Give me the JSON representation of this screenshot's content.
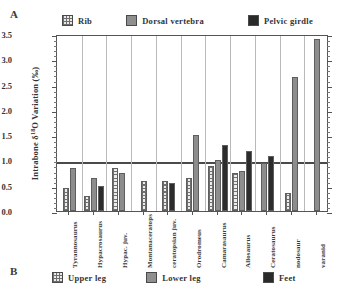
{
  "panels": {
    "a_label": "A",
    "b_label": "B"
  },
  "legend_top": {
    "items": [
      {
        "label": "Rib",
        "swatch": "hatch-swatch-icon",
        "color": "#e9e9e9"
      },
      {
        "label": "Dorsal  vertebra",
        "swatch": "gray-swatch-icon",
        "color": "#8f8f8f"
      },
      {
        "label": "Pelvic  girdle",
        "swatch": "black-swatch-icon",
        "color": "#2a2a2a"
      }
    ]
  },
  "legend_bottom": {
    "items": [
      {
        "label": "Upper  leg",
        "swatch": "hatch-swatch-icon",
        "color": "#e9e9e9"
      },
      {
        "label": "Lower  leg",
        "swatch": "gray-swatch-icon",
        "color": "#8f8f8f"
      },
      {
        "label": "Feet",
        "swatch": "black-swatch-icon",
        "color": "#2a2a2a"
      }
    ]
  },
  "axis": {
    "y_title_pre": "Intrabone ",
    "y_title_delta": "δ",
    "y_title_sup": "18",
    "y_title_post": "O  Variation  (‰)",
    "y_ticks": [
      "3.5",
      "3.0",
      "2.5",
      "2.0",
      "1.5",
      "1.0",
      "0.5",
      "0.0"
    ]
  },
  "chart_data": {
    "type": "bar",
    "title": "",
    "xlabel": "",
    "ylabel": "Intrabone δ18O Variation (‰)",
    "ylim": [
      0.0,
      3.5
    ],
    "ytick_values": [
      0.0,
      0.5,
      1.0,
      1.5,
      2.0,
      2.5,
      3.0,
      3.5
    ],
    "grid": "vertical category separators only",
    "reference_line": 1.0,
    "legend_position": "above plot (panel A) and below plot (panel B)",
    "categories": [
      "Tyrannosaurus",
      "Hypacrosaurus",
      "Hypac. juv.",
      "Montanaceratops",
      "ceratopsian juv.",
      "Orodromeus",
      "Camarasaurus",
      "Allosaurus",
      "Ceratosaurus",
      "nodosaur",
      "varanid"
    ],
    "series": [
      {
        "name": "Rib",
        "key": "rib",
        "values": [
          0.45,
          0.3,
          0.85,
          0.6,
          0.6,
          0.65,
          0.9,
          0.75,
          null,
          0.35,
          null
        ]
      },
      {
        "name": "Dorsal vertebra",
        "key": "vert",
        "values": [
          0.85,
          0.65,
          0.75,
          null,
          null,
          1.5,
          1.0,
          0.8,
          0.95,
          2.65,
          3.4
        ]
      },
      {
        "name": "Pelvic girdle",
        "key": "pelvic",
        "values": [
          null,
          0.5,
          null,
          null,
          0.55,
          null,
          1.3,
          1.18,
          1.08,
          null,
          null
        ]
      }
    ]
  }
}
